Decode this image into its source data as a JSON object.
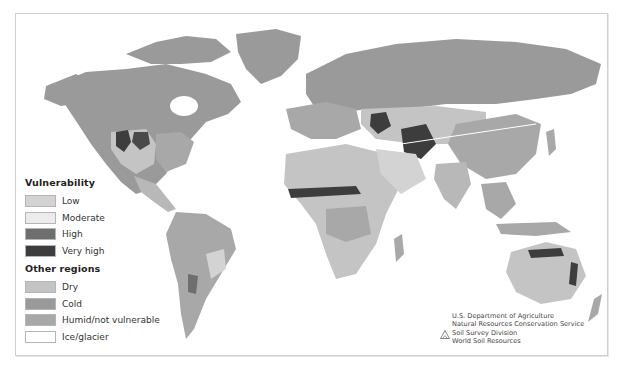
{
  "map": {
    "title": "Global soil vulnerability map",
    "background": "#ffffff",
    "colors": {
      "low": "#d3d3d3",
      "moderate": "#ececec",
      "high": "#6e6e6e",
      "very_high": "#3d3d3d",
      "dry": "#c4c4c4",
      "cold": "#9a9a9a",
      "humid": "#a8a8a8",
      "ice": "#ffffff"
    }
  },
  "legend": {
    "vulnerability_heading": "Vulnerability",
    "vulnerability_items": [
      {
        "label": "Low",
        "color": "#d3d3d3"
      },
      {
        "label": "Moderate",
        "color": "#ececec"
      },
      {
        "label": "High",
        "color": "#6e6e6e"
      },
      {
        "label": "Very high",
        "color": "#3d3d3d"
      }
    ],
    "other_heading": "Other regions",
    "other_items": [
      {
        "label": "Dry",
        "color": "#c4c4c4"
      },
      {
        "label": "Cold",
        "color": "#9a9a9a"
      },
      {
        "label": "Humid/not vulnerable",
        "color": "#a8a8a8"
      },
      {
        "label": "Ice/glacier",
        "color": "#ffffff"
      }
    ]
  },
  "credit": {
    "line1": "U.S. Department of Agriculture",
    "line2": "Natural Resources Conservation Service",
    "line3": "Soil Survey Division",
    "line4": "World Soil Resources"
  }
}
